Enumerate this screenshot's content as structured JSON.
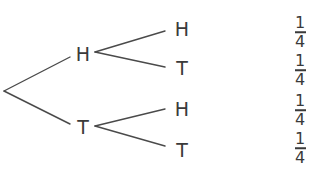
{
  "diagram": {
    "type": "probability-tree",
    "root": {
      "label": ""
    },
    "level1": [
      {
        "label": "H"
      },
      {
        "label": "T"
      }
    ],
    "level2": [
      {
        "parent": "H",
        "label": "H"
      },
      {
        "parent": "H",
        "label": "T"
      },
      {
        "parent": "T",
        "label": "H"
      },
      {
        "parent": "T",
        "label": "T"
      }
    ],
    "probabilities": [
      {
        "numerator": "1",
        "denominator": "4"
      },
      {
        "numerator": "1",
        "denominator": "4"
      },
      {
        "numerator": "1",
        "denominator": "4"
      },
      {
        "numerator": "1",
        "denominator": "4"
      }
    ]
  },
  "colors": {
    "line": "#4a4a4a",
    "text": "#3a3a3a",
    "background": "#ffffff"
  }
}
